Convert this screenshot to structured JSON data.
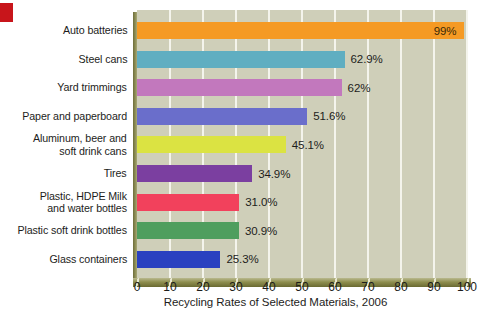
{
  "marker": {
    "name": "red-corner-marker",
    "color": "#c8151b"
  },
  "chart_data": {
    "type": "bar",
    "orientation": "horizontal",
    "title": "",
    "xlabel": "Recycling Rates of Selected Materials, 2006",
    "ylabel": "",
    "xlim": [
      0,
      100
    ],
    "xticks": [
      0,
      10,
      20,
      30,
      40,
      50,
      60,
      70,
      80,
      90,
      100
    ],
    "xtick_labels": [
      "0",
      "10",
      "20",
      "30",
      "40",
      "50",
      "60",
      "70",
      "80",
      "90",
      "100"
    ],
    "grid": "vertical-white-gridlines",
    "legend": "none",
    "plot_background": "#cfcfb9",
    "categories": [
      "Auto batteries",
      "Steel cans",
      "Yard trimmings",
      "Paper and paperboard",
      "Aluminum, beer and\nsoft drink cans",
      "Tires",
      "Plastic, HDPE Milk\nand water bottles",
      "Plastic soft drink bottles",
      "Glass containers"
    ],
    "values": [
      99,
      62.9,
      62,
      51.6,
      45.1,
      34.9,
      31.0,
      30.9,
      25.3
    ],
    "value_labels": [
      "99%",
      "62.9%",
      "62%",
      "51.6%",
      "45.1%",
      "34.9%",
      "31.0%",
      "30.9%",
      "25.3%"
    ],
    "label_placement": [
      "inside",
      "outside",
      "outside",
      "outside",
      "outside",
      "outside",
      "outside",
      "outside",
      "outside"
    ],
    "colors": [
      "#f59a24",
      "#60aec1",
      "#c278bd",
      "#6a6ecb",
      "#dbe342",
      "#7b3fa0",
      "#f2415c",
      "#4f9e5e",
      "#2a41c0"
    ]
  }
}
